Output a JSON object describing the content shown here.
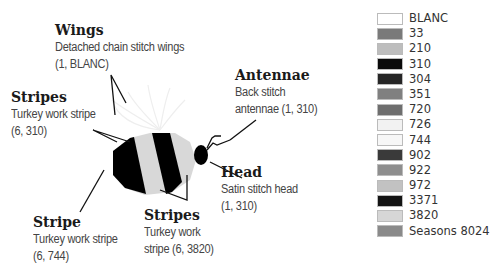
{
  "callouts": {
    "wings": {
      "title": "Wings",
      "line1": "Detached chain stitch wings",
      "line2": "(1, BLANC)"
    },
    "stripes_top": {
      "title": "Stripes",
      "line1": "Turkey work stripe",
      "line2": "(6, 310)"
    },
    "antennae": {
      "title": "Antennae",
      "line1": "Back stitch",
      "line2": "antennae (1, 310)"
    },
    "head": {
      "title": "Head",
      "line1": "Satin stitch head",
      "line2": "(1, 310)"
    },
    "stripe_bottom": {
      "title": "Stripe",
      "line1": "Turkey work stripe",
      "line2": "(6, 744)"
    },
    "stripes_bottom": {
      "title": "Stripes",
      "line1": "Turkey work",
      "line2": "stripe (6, 3820)"
    }
  },
  "legend": {
    "items": [
      {
        "label": "BLANC",
        "color": "#ffffff"
      },
      {
        "label": "33",
        "color": "#7a7a7a"
      },
      {
        "label": "210",
        "color": "#bdbdbd"
      },
      {
        "label": "310",
        "color": "#0a0a0a"
      },
      {
        "label": "304",
        "color": "#262626"
      },
      {
        "label": "351",
        "color": "#808080"
      },
      {
        "label": "720",
        "color": "#6e6e6e"
      },
      {
        "label": "726",
        "color": "#f2f2f2"
      },
      {
        "label": "744",
        "color": "#f7f7f7"
      },
      {
        "label": "902",
        "color": "#3a3a3a"
      },
      {
        "label": "922",
        "color": "#8e8e8e"
      },
      {
        "label": "972",
        "color": "#c2c2c2"
      },
      {
        "label": "3371",
        "color": "#141414"
      },
      {
        "label": "3820",
        "color": "#d6d6d6"
      },
      {
        "label": "Seasons 8024",
        "color": "#8a8a8a"
      }
    ]
  }
}
